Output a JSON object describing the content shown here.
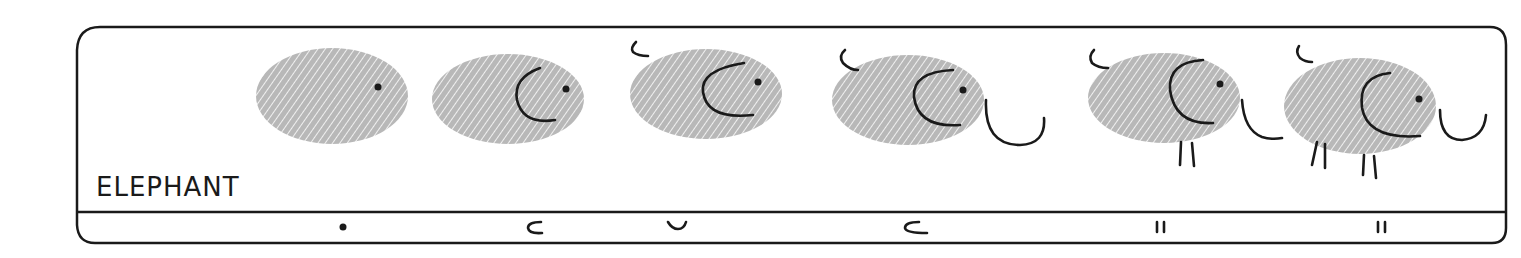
{
  "panel": {
    "title": "ELEPHANT",
    "ink_color": "#1a1a1a",
    "print_color": "#a9a9a9"
  },
  "steps": [
    {
      "index": 1,
      "added_feature": "eye",
      "stroke_glyph": "•"
    },
    {
      "index": 2,
      "added_feature": "ear",
      "stroke_glyph": "c"
    },
    {
      "index": 3,
      "added_feature": "tail",
      "stroke_glyph": "ᴗ"
    },
    {
      "index": 4,
      "added_feature": "trunk",
      "stroke_glyph": "c"
    },
    {
      "index": 5,
      "added_feature": "front-legs",
      "stroke_glyph": "ıı"
    },
    {
      "index": 6,
      "added_feature": "back-legs",
      "stroke_glyph": "ıı"
    }
  ]
}
